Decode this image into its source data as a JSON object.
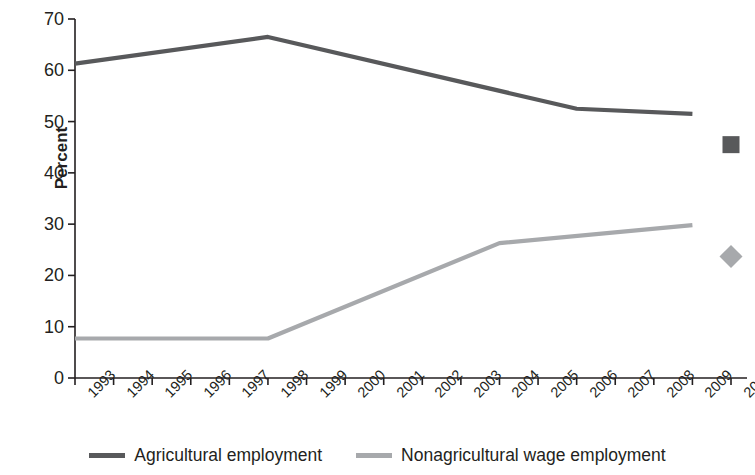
{
  "chart_data": {
    "type": "line",
    "title": "",
    "subtitle": "",
    "xlabel": "",
    "ylabel": "Percent",
    "ylim": [
      0,
      70
    ],
    "yticks": [
      0,
      10,
      20,
      30,
      40,
      50,
      60,
      70
    ],
    "grid": false,
    "legend_position": "bottom",
    "x": [
      1993,
      1994,
      1995,
      1996,
      1997,
      1998,
      1999,
      2000,
      2001,
      2002,
      2003,
      2004,
      2005,
      2006,
      2007,
      2008,
      2009,
      2010
    ],
    "categories": [
      "1993",
      "1994",
      "1995",
      "1996",
      "1997",
      "1998",
      "1999",
      "2000",
      "2001",
      "2002",
      "2003",
      "2004",
      "2005",
      "2006",
      "2007",
      "2008",
      "2009",
      "2010"
    ],
    "series": [
      {
        "name": "Agricultural employment",
        "color": "#58595b",
        "line_x": [
          1993,
          1998,
          2006,
          2009
        ],
        "line_values": [
          61.3,
          66.5,
          52.5,
          51.5
        ],
        "values": [
          61.3,
          62.3,
          63.4,
          64.4,
          65.4,
          66.5,
          64.7,
          62.9,
          61.1,
          59.3,
          57.5,
          55.7,
          54.0,
          52.5,
          52.2,
          51.9,
          51.5,
          45.5
        ],
        "marker_point": {
          "x": 2010,
          "value": 45.5,
          "shape": "square"
        }
      },
      {
        "name": "Nonagricultural wage employment",
        "color": "#a7a9ac",
        "line_x": [
          1993,
          1998,
          2004,
          2009
        ],
        "line_values": [
          7.7,
          7.7,
          26.3,
          29.8
        ],
        "values": [
          7.7,
          7.7,
          7.7,
          7.7,
          7.7,
          7.7,
          10.8,
          13.9,
          17.0,
          20.1,
          23.2,
          26.3,
          27.5,
          28.3,
          29.0,
          29.4,
          29.8,
          23.7
        ],
        "marker_point": {
          "x": 2010,
          "value": 23.7,
          "shape": "diamond"
        }
      }
    ]
  },
  "axes": {
    "y_title": "Percent",
    "y_tick_labels": [
      "0",
      "10",
      "20",
      "30",
      "40",
      "50",
      "60",
      "70"
    ],
    "x_tick_labels": [
      "1993",
      "1994",
      "1995",
      "1996",
      "1997",
      "1998",
      "1999",
      "2000",
      "2001",
      "2002",
      "2003",
      "2004",
      "2005",
      "2006",
      "2007",
      "2008",
      "2009",
      "2010"
    ],
    "axis_color": "#231f20"
  },
  "legend": {
    "items": [
      {
        "label": "Agricultural employment",
        "color": "#58595b"
      },
      {
        "label": "Nonagricultural wage employment",
        "color": "#a7a9ac"
      }
    ]
  }
}
